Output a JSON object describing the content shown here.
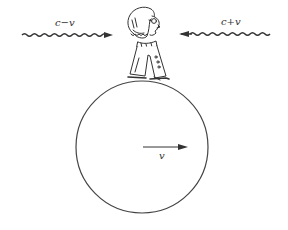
{
  "figure": {
    "type": "physics-illustration"
  },
  "labels": {
    "left_wave": "c−v",
    "right_wave": "c+v",
    "velocity": "v"
  },
  "elements": {
    "left_wave": {
      "direction": "right",
      "x_start": 22,
      "x_end": 112,
      "y": 35
    },
    "right_wave": {
      "direction": "left",
      "x_start": 180,
      "x_end": 270,
      "y": 34
    },
    "planet": {
      "cx": 142,
      "cy": 147,
      "r": 66
    },
    "velocity_arrow": {
      "x_start": 143,
      "x_end": 187,
      "y": 147
    },
    "observer": {
      "x": 122,
      "y": 4,
      "width": 48,
      "height": 78
    }
  },
  "colors": {
    "ink": "#333333",
    "background": "#ffffff"
  }
}
